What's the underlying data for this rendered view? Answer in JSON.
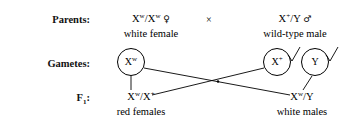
{
  "diagram": {
    "background_color": "#ffffff",
    "line_color": "#000000",
    "rows": {
      "parents_label": "Parents:",
      "gametes_label": "Gametes:",
      "f1_label_base": "F",
      "f1_label_sub": "1",
      "f1_label_colon": ":"
    },
    "cross_symbol": "×",
    "parents": {
      "female": {
        "genotype_prefix": "X",
        "genotype_sup1": "w",
        "genotype_mid": "/X",
        "genotype_sup2": "w",
        "sex_symbol": "♀",
        "phenotype": "white female"
      },
      "male": {
        "genotype_prefix": "X",
        "genotype_sup1": "+",
        "genotype_mid": "/Y",
        "sex_symbol": "♂",
        "phenotype": "wild-type male"
      }
    },
    "gametes": [
      {
        "name": "egg-xw",
        "base": "X",
        "sup": "w",
        "has_tail": false
      },
      {
        "name": "sperm-xplus",
        "base": "X",
        "sup": "+",
        "has_tail": true
      },
      {
        "name": "sperm-y",
        "base": "Y",
        "sup": "",
        "has_tail": true
      }
    ],
    "f1": {
      "females": {
        "genotype_prefix": "X",
        "genotype_sup1": "w",
        "genotype_mid": "/X",
        "genotype_sup2": "+",
        "phenotype": "red females"
      },
      "males": {
        "genotype_prefix": "X",
        "genotype_sup1": "w",
        "genotype_mid": "/Y",
        "phenotype": "white males"
      }
    }
  }
}
